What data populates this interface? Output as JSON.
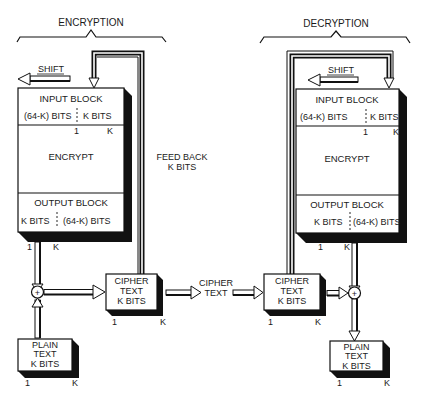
{
  "diagram": {
    "type": "cipher-feedback-mode-block-diagram",
    "colors": {
      "ink": "#111111",
      "paper": "#ffffff"
    },
    "encryption": {
      "title": "ENCRYPTION",
      "shift_label": "SHIFT",
      "input_block": {
        "title": "INPUT BLOCK",
        "left_field": "(64-K) BITS",
        "right_field": "K BITS",
        "index_start": "1",
        "index_end": "K"
      },
      "encrypt_label": "ENCRYPT",
      "output_block": {
        "title": "OUTPUT BLOCK",
        "left_field": "K BITS",
        "right_field": "(64-K) BITS",
        "index_start": "1",
        "index_end": "K"
      },
      "feedback_label_line1": "FEED BACK",
      "feedback_label_line2": "K BITS",
      "xor_symbol": "+",
      "cipher_text_box": {
        "line1": "CIPHER",
        "line2": "TEXT",
        "line3": "K BITS",
        "index_start": "1",
        "index_end": "K"
      },
      "plain_text_box": {
        "line1": "PLAIN",
        "line2": "TEXT",
        "line3": "K BITS",
        "index_start": "1",
        "index_end": "K"
      }
    },
    "channel": {
      "line1": "CIPHER",
      "line2": "TEXT"
    },
    "decryption": {
      "title": "DECRYPTION",
      "shift_label": "SHIFT",
      "input_block": {
        "title": "INPUT BLOCK",
        "left_field": "(64-K) BITS",
        "right_field": "K BITS",
        "index_start": "1",
        "index_end": "K"
      },
      "encrypt_label": "ENCRYPT",
      "output_block": {
        "title": "OUTPUT BLOCK",
        "left_field": "K  BITS",
        "right_field": "(64-K) BITS",
        "index_start": "1",
        "index_end": "K"
      },
      "xor_symbol": "+",
      "cipher_text_box": {
        "line1": "CIPHER",
        "line2": "TEXT",
        "line3": "K BITS",
        "index_start": "1",
        "index_end": "K"
      },
      "plain_text_box": {
        "line1": "PLAIN",
        "line2": "TEXT",
        "line3": "K BITS",
        "index_start": "1",
        "index_end": "K"
      }
    }
  }
}
